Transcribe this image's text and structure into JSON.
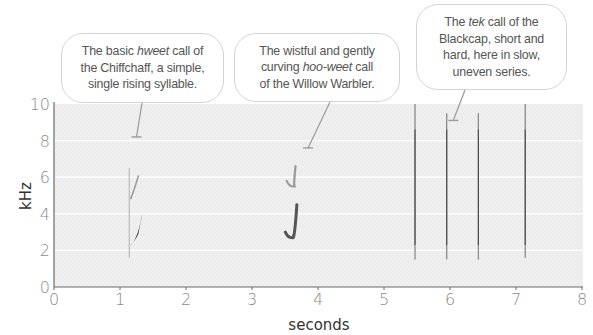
{
  "chart_data": {
    "type": "heatmap",
    "subtype": "spectrogram",
    "title": "",
    "xlabel": "seconds",
    "ylabel": "kHz",
    "xlim": [
      0,
      8
    ],
    "ylim": [
      0,
      10
    ],
    "x_ticks": [
      0,
      1,
      2,
      3,
      4,
      5,
      6,
      7,
      8
    ],
    "y_ticks": [
      0,
      2,
      4,
      6,
      8,
      10
    ],
    "grid": {
      "horizontal": true,
      "at": [
        2,
        4,
        6,
        8
      ],
      "color": "#ffffff"
    },
    "legend": null,
    "series": [
      {
        "name": "Chiffchaff hweet",
        "calls": [
          {
            "t_start": 1.14,
            "t_end": 1.34,
            "f_start": 2.4,
            "f_end": 4.0,
            "shape": "rising",
            "intensity": "dark"
          },
          {
            "t_start": 1.16,
            "t_end": 1.28,
            "f_start": 4.8,
            "f_end": 6.1,
            "shape": "rising-harmonic",
            "intensity": "light"
          },
          {
            "t_start": 1.14,
            "t_end": 1.14,
            "f_start": 1.6,
            "f_end": 6.5,
            "shape": "vertical-onset",
            "intensity": "faint"
          }
        ]
      },
      {
        "name": "Willow Warbler hoo-weet",
        "calls": [
          {
            "t_start": 3.52,
            "t_end": 3.68,
            "f_start": 3.0,
            "f_end": 4.5,
            "low": 2.7,
            "shape": "hook",
            "intensity": "medium"
          },
          {
            "t_start": 3.54,
            "t_end": 3.66,
            "f_start": 5.8,
            "f_end": 6.6,
            "low": 5.5,
            "shape": "hook-harmonic",
            "intensity": "light"
          }
        ]
      },
      {
        "name": "Blackcap tek",
        "calls": [
          {
            "t": 5.47,
            "f_low": 1.5,
            "f_high": 10.0,
            "intensity": "medium"
          },
          {
            "t": 5.95,
            "f_low": 1.5,
            "f_high": 9.5,
            "intensity": "medium"
          },
          {
            "t": 6.43,
            "f_low": 1.5,
            "f_high": 9.5,
            "intensity": "medium"
          },
          {
            "t": 7.14,
            "f_low": 1.6,
            "f_high": 10.0,
            "intensity": "medium"
          }
        ]
      }
    ],
    "annotations": [
      {
        "text": "The basic hweet call of the Chiffchaff, a simple, single rising syllable.",
        "pointer_t": 1.25,
        "pointer_f": 8.2
      },
      {
        "text": "The wistful and gently curving hoo-weet call of the Willow Warbler.",
        "pointer_t": 3.85,
        "pointer_f": 7.6
      },
      {
        "text": "The tek call of the Blackcap, short and hard, here in slow, uneven series.",
        "pointer_t": 6.05,
        "pointer_f": 9.1
      }
    ]
  },
  "colors": {
    "plot_bg": "#efefef",
    "axis": "#6a6a6a",
    "tick_label": "#8a8a8a",
    "axis_title": "#333333",
    "signal_dark": "#1a1a1a",
    "signal_mid": "#555555",
    "signal_light": "#9a9a9a",
    "pointer": "#9a9a9a"
  },
  "axes": {
    "x_label": "seconds",
    "y_label": "kHz",
    "x_tick_labels": [
      "0",
      "1",
      "2",
      "3",
      "4",
      "5",
      "6",
      "7",
      "8"
    ],
    "y_tick_labels": [
      "0",
      "2",
      "4",
      "6",
      "8",
      "10"
    ]
  },
  "callouts": [
    {
      "id": "chiffchaff",
      "lines": [
        [
          "The basic ",
          "hweet",
          " call of"
        ],
        [
          "the Chiffchaff, a simple,"
        ],
        [
          "single rising syllable."
        ]
      ]
    },
    {
      "id": "willow-warbler",
      "lines": [
        [
          "The wistful and gently"
        ],
        [
          "curving ",
          "hoo-weet",
          " call"
        ],
        [
          "of the Willow Warbler."
        ]
      ]
    },
    {
      "id": "blackcap",
      "lines": [
        [
          "The ",
          "tek",
          " call of the"
        ],
        [
          "Blackcap, short and"
        ],
        [
          "hard, here in slow,"
        ],
        [
          "uneven series."
        ]
      ]
    }
  ]
}
